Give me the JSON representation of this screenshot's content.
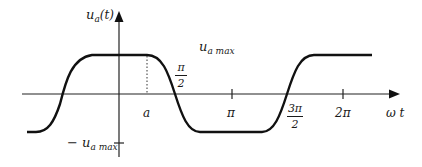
{
  "diagram": {
    "type": "waveform",
    "y_axis_label": {
      "main": "u",
      "sub": "a",
      "arg": "(t)"
    },
    "x_axis_label": "ω t",
    "max_label": {
      "main": "u",
      "sub": "a max"
    },
    "min_label": {
      "prefix": "−",
      "main": "u",
      "sub": "a max"
    },
    "tick_labels": {
      "a": "a",
      "pi_half_num": "π",
      "pi_half_den": "2",
      "pi": "π",
      "three_pi_half_num": "3π",
      "three_pi_half_den": "2",
      "two_pi": "2π"
    },
    "colors": {
      "line": "#111111",
      "text": "#1a1a1a",
      "background": "#ffffff"
    }
  }
}
